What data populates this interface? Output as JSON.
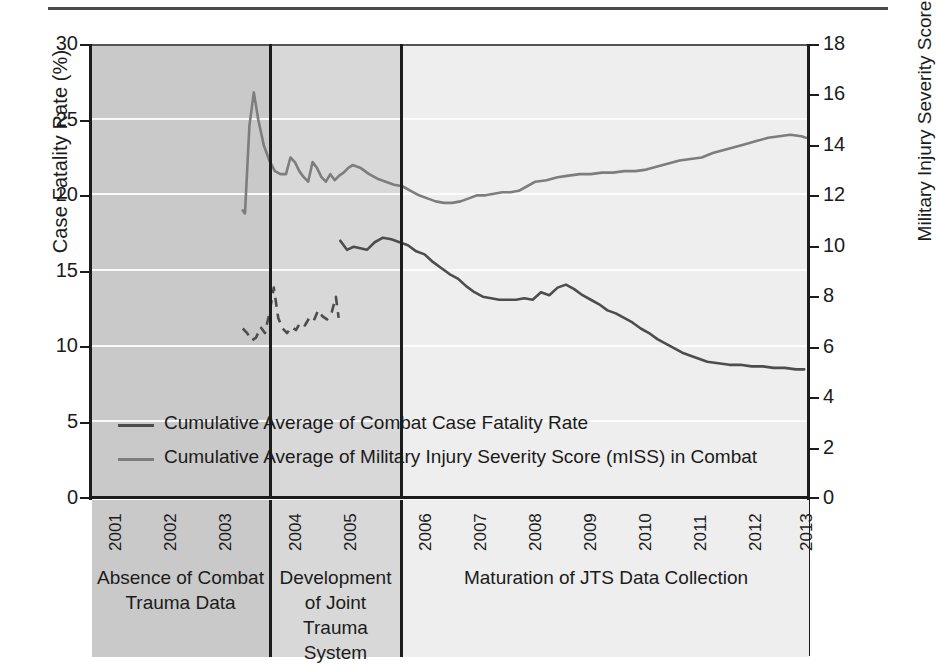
{
  "chart_data": {
    "type": "line",
    "title": "",
    "xlabel": "",
    "ylabel": "Case Fatality Rate (%)",
    "y2label": "Military Injury Severity Score",
    "xlim": [
      2001,
      2013.9
    ],
    "ylim": [
      0,
      30
    ],
    "y2lim": [
      0,
      18
    ],
    "grid": true,
    "legend_position": "inside-lower-left",
    "x_ticks": [
      "2001",
      "2002",
      "2003",
      "2004",
      "2005",
      "2006",
      "2007",
      "2008",
      "2009",
      "2010",
      "2011",
      "2012",
      "2013"
    ],
    "y_ticks": [
      "0",
      "5",
      "10",
      "15",
      "20",
      "25",
      "30"
    ],
    "y2_ticks": [
      "0",
      "2",
      "4",
      "6",
      "8",
      "10",
      "12",
      "14",
      "16",
      "18"
    ],
    "background_bands": [
      {
        "label": "Absence of Combat\nTrauma Data",
        "start": 2001,
        "end": 2003.6,
        "color": "#c9c9c9"
      },
      {
        "label": "Development\nof Joint Trauma\nSystem",
        "start": 2003.6,
        "end": 2005.65,
        "color": "#d8d8d8"
      },
      {
        "label": "Maturation of JTS Data Collection",
        "start": 2005.65,
        "end": 2013.9,
        "color": "#eeeeee"
      }
    ],
    "series": [
      {
        "name": "Cumulative Average of Combat Case Fatality Rate",
        "axis": "left",
        "units": "%",
        "color": "#4d4d4d",
        "dashed_segment_end_x": 2005.45,
        "x": [
          2003.72,
          2003.8,
          2003.88,
          2003.96,
          2004.04,
          2004.12,
          2004.2,
          2004.28,
          2004.36,
          2004.44,
          2004.52,
          2004.6,
          2004.68,
          2004.76,
          2004.84,
          2004.92,
          2005.0,
          2005.08,
          2005.16,
          2005.24,
          2005.32,
          2005.4,
          2005.45,
          2005.48,
          2005.6,
          2005.72,
          2005.84,
          2005.96,
          2006.1,
          2006.25,
          2006.4,
          2006.55,
          2006.7,
          2006.85,
          2007.0,
          2007.15,
          2007.3,
          2007.45,
          2007.6,
          2007.75,
          2007.9,
          2008.05,
          2008.2,
          2008.35,
          2008.5,
          2008.65,
          2008.8,
          2008.95,
          2009.1,
          2009.25,
          2009.4,
          2009.55,
          2009.7,
          2009.85,
          2010.0,
          2010.15,
          2010.3,
          2010.45,
          2010.6,
          2010.75,
          2010.9,
          2011.05,
          2011.2,
          2011.35,
          2011.5,
          2011.65,
          2011.8,
          2011.95,
          2012.1,
          2012.3,
          2012.5,
          2012.7,
          2012.9,
          2013.1,
          2013.3,
          2013.5,
          2013.7,
          2013.85
        ],
        "y": [
          11.2,
          10.9,
          10.4,
          10.6,
          11.3,
          10.9,
          12.2,
          13.9,
          11.9,
          11.2,
          10.9,
          11.3,
          11.1,
          11.6,
          11.4,
          11.9,
          11.7,
          12.4,
          12.0,
          11.8,
          12.2,
          13.3,
          11.9,
          17.0,
          16.4,
          16.6,
          16.5,
          16.4,
          16.9,
          17.2,
          17.1,
          16.9,
          16.7,
          16.3,
          16.1,
          15.6,
          15.2,
          14.8,
          14.5,
          14.0,
          13.6,
          13.3,
          13.2,
          13.1,
          13.1,
          13.1,
          13.2,
          13.1,
          13.6,
          13.4,
          13.9,
          14.1,
          13.8,
          13.4,
          13.1,
          12.8,
          12.4,
          12.2,
          11.9,
          11.6,
          11.2,
          10.9,
          10.5,
          10.2,
          9.9,
          9.6,
          9.4,
          9.2,
          9.0,
          8.9,
          8.8,
          8.8,
          8.7,
          8.7,
          8.6,
          8.6,
          8.5,
          8.5
        ]
      },
      {
        "name": "Cumulative Average of Military Injury Severity Score (mISS) in Combat",
        "axis": "right",
        "units": "mISS",
        "color": "#7d7d7d",
        "x": [
          2003.72,
          2003.76,
          2003.84,
          2003.92,
          2004.0,
          2004.1,
          2004.2,
          2004.3,
          2004.4,
          2004.5,
          2004.58,
          2004.66,
          2004.74,
          2004.82,
          2004.9,
          2004.98,
          2005.06,
          2005.14,
          2005.22,
          2005.3,
          2005.38,
          2005.46,
          2005.54,
          2005.62,
          2005.7,
          2005.85,
          2006.0,
          2006.15,
          2006.3,
          2006.45,
          2006.6,
          2006.75,
          2006.9,
          2007.05,
          2007.2,
          2007.35,
          2007.5,
          2007.65,
          2007.8,
          2007.95,
          2008.1,
          2008.25,
          2008.4,
          2008.55,
          2008.7,
          2008.85,
          2009.0,
          2009.2,
          2009.4,
          2009.6,
          2009.8,
          2010.0,
          2010.2,
          2010.4,
          2010.6,
          2010.8,
          2011.0,
          2011.2,
          2011.4,
          2011.6,
          2011.8,
          2012.0,
          2012.2,
          2012.4,
          2012.6,
          2012.8,
          2013.0,
          2013.2,
          2013.4,
          2013.6,
          2013.8,
          2013.88
        ],
        "y_left_scale": [
          19.0,
          18.8,
          24.6,
          26.8,
          25.0,
          23.3,
          22.3,
          21.6,
          21.4,
          21.4,
          22.5,
          22.2,
          21.6,
          21.2,
          20.9,
          22.2,
          21.8,
          21.2,
          20.9,
          21.4,
          21.0,
          21.3,
          21.5,
          21.8,
          22.0,
          21.8,
          21.4,
          21.1,
          20.9,
          20.7,
          20.6,
          20.3,
          20.0,
          19.8,
          19.6,
          19.5,
          19.5,
          19.6,
          19.8,
          20.0,
          20.0,
          20.1,
          20.2,
          20.2,
          20.3,
          20.6,
          20.9,
          21.0,
          21.2,
          21.3,
          21.4,
          21.4,
          21.5,
          21.5,
          21.6,
          21.6,
          21.7,
          21.9,
          22.1,
          22.3,
          22.4,
          22.5,
          22.8,
          23.0,
          23.2,
          23.4,
          23.6,
          23.8,
          23.9,
          24.0,
          23.9,
          23.8
        ],
        "y": [
          11.4,
          11.3,
          14.8,
          16.1,
          15.0,
          14.0,
          13.4,
          13.0,
          12.8,
          12.8,
          13.5,
          13.3,
          13.0,
          12.7,
          12.5,
          13.3,
          13.1,
          12.7,
          12.5,
          12.8,
          12.6,
          12.8,
          12.9,
          13.1,
          13.2,
          13.1,
          12.8,
          12.7,
          12.5,
          12.4,
          12.4,
          12.2,
          12.0,
          11.9,
          11.8,
          11.7,
          11.7,
          11.8,
          11.9,
          12.0,
          12.0,
          12.1,
          12.1,
          12.1,
          12.2,
          12.4,
          12.5,
          12.6,
          12.7,
          12.8,
          12.8,
          12.8,
          12.9,
          12.9,
          13.0,
          13.0,
          13.0,
          13.1,
          13.3,
          13.4,
          13.4,
          13.5,
          13.7,
          13.8,
          13.9,
          14.0,
          14.2,
          14.3,
          14.3,
          14.4,
          14.3,
          14.3
        ]
      }
    ]
  },
  "axes": {
    "left_title": "Case Fatality Rate (%)",
    "right_title": "Military Injury Severity Score",
    "left_ticks": [
      "30",
      "25",
      "20",
      "15",
      "10",
      "5",
      "0"
    ],
    "right_ticks": [
      "18",
      "16",
      "14",
      "12",
      "10",
      "8",
      "6",
      "4",
      "2",
      "0"
    ],
    "x_ticks": [
      "2001",
      "2002",
      "2003",
      "2004",
      "2005",
      "2006",
      "2007",
      "2008",
      "2009",
      "2010",
      "2011",
      "2012",
      "2013"
    ]
  },
  "legend": {
    "items": [
      {
        "label": "Cumulative Average of Combat Case Fatality Rate",
        "color": "#4d4d4d"
      },
      {
        "label": "Cumulative Average of Military Injury Severity Score (mISS) in Combat",
        "color": "#7d7d7d"
      }
    ]
  },
  "periods": [
    {
      "line1": "Absence of Combat",
      "line2": "Trauma Data",
      "line3": ""
    },
    {
      "line1": "Development",
      "line2": "of Joint Trauma",
      "line3": "System"
    },
    {
      "line1": "Maturation of JTS Data Collection",
      "line2": "",
      "line3": ""
    }
  ],
  "colors": {
    "cfr_line": "#4d4d4d",
    "miss_line": "#7d7d7d",
    "band_1": "#c9c9c9",
    "band_2": "#d8d8d8",
    "band_3": "#eeeeee",
    "axis": "#1c1c1c",
    "gridline": "#fdfdfd"
  }
}
